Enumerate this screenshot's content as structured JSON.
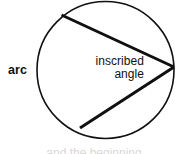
{
  "figure": {
    "background_color": "#ffffff",
    "stroke_color": "#101010",
    "width": 188,
    "height": 154
  },
  "labels": {
    "arc": "arc",
    "inscribed": "inscribed",
    "angle": "angle",
    "clipped_caption": "and the beginning"
  },
  "chart_data": {
    "type": "diagram",
    "shapes": [
      {
        "name": "circle",
        "type": "circle",
        "cx": 105.5,
        "cy": 70,
        "r": 68.5,
        "stroke": "#101010",
        "stroke_width": 1.6,
        "fill": "none"
      },
      {
        "name": "upper-chord",
        "type": "line",
        "x1": 174,
        "y1": 67,
        "x2": 61.5,
        "y2": 15,
        "stroke": "#101010",
        "stroke_width": 3
      },
      {
        "name": "lower-chord",
        "type": "line",
        "x1": 174,
        "y1": 67,
        "x2": 80,
        "y2": 128,
        "stroke": "#101010",
        "stroke_width": 3
      }
    ],
    "points": [
      {
        "name": "vertex",
        "x": 174,
        "y": 67
      },
      {
        "name": "upper-endpoint",
        "x": 61.5,
        "y": 15
      },
      {
        "name": "lower-endpoint",
        "x": 80,
        "y": 128
      }
    ],
    "annotations": [
      {
        "name": "arc-label",
        "text": "arc",
        "x": 8,
        "y": 71
      },
      {
        "name": "inscribed-angle-label",
        "text": "inscribed angle",
        "x": 118,
        "y": 69
      }
    ]
  }
}
